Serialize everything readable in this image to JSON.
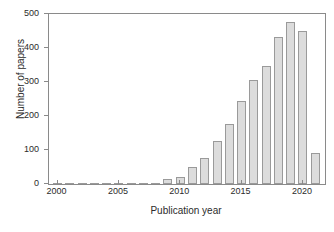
{
  "chart_data": {
    "type": "bar",
    "title": "",
    "xlabel": "Publication year",
    "ylabel": "Number of papers",
    "categories": [
      2000,
      2001,
      2002,
      2003,
      2004,
      2005,
      2006,
      2007,
      2008,
      2009,
      2010,
      2011,
      2012,
      2013,
      2014,
      2015,
      2016,
      2017,
      2018,
      2019,
      2020,
      2021
    ],
    "values": [
      0,
      0,
      0,
      1,
      2,
      2,
      1,
      1,
      3,
      14,
      22,
      51,
      76,
      127,
      177,
      243,
      307,
      347,
      433,
      477,
      450,
      90
    ],
    "xlim": [
      1999.3,
      2021.8
    ],
    "ylim": [
      0,
      500
    ],
    "ytick_labels": [
      "0",
      "100",
      "200",
      "300",
      "400",
      "500"
    ],
    "ytick_values": [
      0,
      100,
      200,
      300,
      400,
      500
    ],
    "xtick_labels": [
      "2000",
      "2005",
      "2010",
      "2015",
      "2020"
    ],
    "xtick_values": [
      2000,
      2005,
      2010,
      2015,
      2020
    ],
    "grid": false,
    "legend": null,
    "bar_fill_color": "#dcdcdc",
    "bar_edge_color": "#9a9a9a",
    "axis_color": "#8a8a8a",
    "text_color": "#2b2b2b"
  }
}
